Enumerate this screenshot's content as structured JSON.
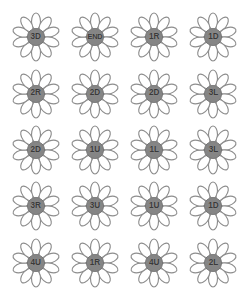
{
  "board": {
    "title": "Flower Path Grid",
    "background_color": "#ffffff",
    "columns": 4,
    "rows": 5,
    "petal_count": 10,
    "petal_fill_color": "#ffffff",
    "petal_stroke_color": "#8d8d8d",
    "center_fill_color": "#858585",
    "center_stroke_color": "#6f6f6f",
    "label_color": "#3a3a3a"
  },
  "flowers": [
    {
      "label": "3D",
      "row": 1,
      "col": 1
    },
    {
      "label": "END",
      "row": 1,
      "col": 2
    },
    {
      "label": "1R",
      "row": 1,
      "col": 3
    },
    {
      "label": "1D",
      "row": 1,
      "col": 4
    },
    {
      "label": "2R",
      "row": 2,
      "col": 1
    },
    {
      "label": "2D",
      "row": 2,
      "col": 2
    },
    {
      "label": "2D",
      "row": 2,
      "col": 3
    },
    {
      "label": "3L",
      "row": 2,
      "col": 4
    },
    {
      "label": "2D",
      "row": 3,
      "col": 1
    },
    {
      "label": "1U",
      "row": 3,
      "col": 2
    },
    {
      "label": "1L",
      "row": 3,
      "col": 3
    },
    {
      "label": "3L",
      "row": 3,
      "col": 4
    },
    {
      "label": "3R",
      "row": 4,
      "col": 1
    },
    {
      "label": "3U",
      "row": 4,
      "col": 2
    },
    {
      "label": "1U",
      "row": 4,
      "col": 3
    },
    {
      "label": "1D",
      "row": 4,
      "col": 4
    },
    {
      "label": "4U",
      "row": 5,
      "col": 1
    },
    {
      "label": "1R",
      "row": 5,
      "col": 2
    },
    {
      "label": "4U",
      "row": 5,
      "col": 3
    },
    {
      "label": "2L",
      "row": 5,
      "col": 4
    }
  ]
}
